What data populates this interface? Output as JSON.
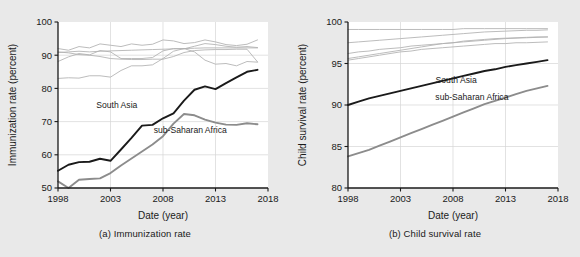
{
  "figure": {
    "background_color": "#e9e9e9",
    "panel_background_color": "#ffffff"
  },
  "colors": {
    "south_asia": "#1a1a1a",
    "sub_saharan_africa": "#8c8c8c",
    "other_regions": "#b0b0b0",
    "grid": "#d6d6d6",
    "axis": "#1a1a1a",
    "text": "#1a1a1a"
  },
  "panels": [
    {
      "id": "a",
      "caption": "(a) Immunization rate",
      "xlabel": "Date (year)",
      "ylabel": "Immunization rate (percent)",
      "xticks": [
        "1998",
        "2003",
        "2008",
        "2013",
        "2018"
      ],
      "yticks": [
        "50",
        "60",
        "70",
        "80",
        "90",
        "100"
      ],
      "annotations": [
        {
          "label": "South Asia",
          "x": 2003.6,
          "y": 74.2
        },
        {
          "label": "sub-Saharan Africa",
          "x": 2010.6,
          "y": 66.6
        }
      ]
    },
    {
      "id": "b",
      "caption": "(b) Child survival rate",
      "xlabel": "Date (year)",
      "ylabel": "Child survival rate (percent)",
      "xticks": [
        "1998",
        "2003",
        "2008",
        "2013",
        "2018"
      ],
      "yticks": [
        "80",
        "85",
        "90",
        "95",
        "100"
      ],
      "annotations": [
        {
          "label": "South Asia",
          "x": 2008.3,
          "y": 92.7
        },
        {
          "label": "sub-Saharan Africa",
          "x": 2009.8,
          "y": 90.6
        }
      ]
    }
  ],
  "chart_data": [
    {
      "type": "line",
      "title": "(a) Immunization rate",
      "xlabel": "Date (year)",
      "ylabel": "Immunization rate (percent)",
      "xlim": [
        1998,
        2018
      ],
      "ylim": [
        50,
        100
      ],
      "xticks": [
        1998,
        2003,
        2008,
        2013,
        2018
      ],
      "yticks": [
        50,
        60,
        70,
        80,
        90,
        100
      ],
      "grid": true,
      "legend": "inline-annotations",
      "x": [
        1998,
        1999,
        2000,
        2001,
        2002,
        2003,
        2004,
        2005,
        2006,
        2007,
        2008,
        2009,
        2010,
        2011,
        2012,
        2013,
        2014,
        2015,
        2016,
        2017
      ],
      "series": [
        {
          "name": "South Asia",
          "color": "#1a1a1a",
          "emphasis": true,
          "values": [
            55.2,
            57.0,
            57.8,
            57.9,
            58.8,
            58.2,
            61.6,
            65.1,
            68.8,
            69.0,
            71.0,
            72.5,
            76.3,
            79.6,
            80.6,
            79.8,
            81.6,
            83.3,
            85.0,
            85.6
          ]
        },
        {
          "name": "sub-Saharan Africa",
          "color": "#8c8c8c",
          "emphasis": true,
          "values": [
            52.0,
            50.0,
            52.5,
            52.7,
            52.9,
            54.5,
            56.8,
            58.9,
            61.0,
            63.1,
            65.6,
            69.4,
            72.3,
            71.9,
            70.6,
            69.7,
            69.1,
            69.0,
            69.5,
            69.2
          ]
        },
        {
          "name": "region-3",
          "color": "#b0b0b0",
          "emphasis": false,
          "values": [
            92.0,
            91.5,
            92.6,
            92.2,
            93.4,
            93.0,
            92.6,
            93.4,
            93.0,
            93.3,
            94.6,
            94.3,
            93.5,
            93.8,
            94.6,
            94.0,
            93.2,
            92.9,
            93.3,
            94.6
          ]
        },
        {
          "name": "region-4",
          "color": "#b0b0b0",
          "emphasis": false,
          "values": [
            90.8,
            91.0,
            91.2,
            91.0,
            91.2,
            91.3,
            91.4,
            91.5,
            91.6,
            91.7,
            91.8,
            91.9,
            92.0,
            92.1,
            92.2,
            92.2,
            92.2,
            92.2,
            92.2,
            92.2
          ]
        },
        {
          "name": "region-5",
          "color": "#b0b0b0",
          "emphasis": false,
          "values": [
            88.1,
            89.5,
            90.5,
            90.1,
            91.4,
            91.0,
            89.0,
            89.0,
            89.0,
            89.3,
            91.3,
            92.0,
            91.9,
            92.7,
            93.5,
            93.2,
            92.7,
            92.4,
            92.6,
            92.3
          ]
        },
        {
          "name": "region-6",
          "color": "#b0b0b0",
          "emphasis": false,
          "values": [
            91.0,
            90.7,
            90.2,
            90.0,
            89.6,
            89.0,
            88.8,
            88.7,
            88.7,
            88.8,
            88.8,
            89.6,
            90.8,
            91.4,
            91.6,
            91.7,
            91.7,
            91.8,
            91.8,
            88.0
          ]
        },
        {
          "name": "region-7",
          "color": "#b0b0b0",
          "emphasis": false,
          "values": [
            83.0,
            83.2,
            83.1,
            83.8,
            83.8,
            83.4,
            85.4,
            86.8,
            86.8,
            87.1,
            89.0,
            91.2,
            92.0,
            91.0,
            88.5,
            87.3,
            87.5,
            86.8,
            88.1,
            87.9
          ]
        }
      ]
    },
    {
      "type": "line",
      "title": "(b) Child survival rate",
      "xlabel": "Date (year)",
      "ylabel": "Child survival rate (percent)",
      "xlim": [
        1998,
        2018
      ],
      "ylim": [
        80,
        100
      ],
      "xticks": [
        1998,
        2003,
        2008,
        2013,
        2018
      ],
      "yticks": [
        80,
        85,
        90,
        95,
        100
      ],
      "grid": true,
      "legend": "inline-annotations",
      "x": [
        1998,
        1999,
        2000,
        2001,
        2002,
        2003,
        2004,
        2005,
        2006,
        2007,
        2008,
        2009,
        2010,
        2011,
        2012,
        2013,
        2014,
        2015,
        2016,
        2017
      ],
      "series": [
        {
          "name": "South Asia",
          "color": "#1a1a1a",
          "emphasis": true,
          "values": [
            90.0,
            90.4,
            90.8,
            91.1,
            91.4,
            91.7,
            92.0,
            92.3,
            92.6,
            92.9,
            93.2,
            93.5,
            93.8,
            94.1,
            94.3,
            94.6,
            94.8,
            95.0,
            95.2,
            95.4
          ]
        },
        {
          "name": "sub-Saharan Africa",
          "color": "#8c8c8c",
          "emphasis": true,
          "values": [
            83.8,
            84.2,
            84.6,
            85.1,
            85.6,
            86.1,
            86.6,
            87.1,
            87.6,
            88.1,
            88.6,
            89.1,
            89.6,
            90.1,
            90.5,
            90.9,
            91.3,
            91.7,
            92.0,
            92.3
          ]
        },
        {
          "name": "region-3",
          "color": "#b0b0b0",
          "emphasis": false,
          "values": [
            99.1,
            99.1,
            99.1,
            99.1,
            99.1,
            99.1,
            99.1,
            99.1,
            99.1,
            99.1,
            99.1,
            99.2,
            99.2,
            99.2,
            99.2,
            99.2,
            99.2,
            99.2,
            99.2,
            99.2
          ]
        },
        {
          "name": "region-4",
          "color": "#b0b0b0",
          "emphasis": false,
          "values": [
            97.5,
            97.6,
            97.7,
            97.8,
            97.9,
            98.0,
            98.1,
            98.2,
            98.3,
            98.4,
            98.5,
            98.6,
            98.7,
            98.8,
            98.85,
            98.9,
            98.95,
            99.0,
            99.0,
            99.05
          ]
        },
        {
          "name": "region-5",
          "color": "#b0b0b0",
          "emphasis": false,
          "values": [
            96.2,
            96.4,
            96.5,
            96.7,
            96.8,
            96.9,
            97.1,
            97.2,
            97.3,
            97.4,
            97.5,
            97.6,
            97.7,
            97.8,
            97.9,
            98.0,
            98.05,
            98.1,
            98.15,
            98.2
          ]
        },
        {
          "name": "region-6",
          "color": "#b0b0b0",
          "emphasis": false,
          "values": [
            95.6,
            95.8,
            96.0,
            96.2,
            96.4,
            96.6,
            96.8,
            97.0,
            97.2,
            97.4,
            97.5,
            97.7,
            97.8,
            97.9,
            98.0,
            98.05,
            98.1,
            98.15,
            98.2,
            98.2
          ]
        },
        {
          "name": "region-7",
          "color": "#b0b0b0",
          "emphasis": false,
          "values": [
            95.4,
            95.6,
            95.8,
            96.0,
            96.2,
            96.4,
            96.5,
            96.7,
            96.8,
            96.9,
            97.0,
            97.1,
            97.2,
            97.3,
            97.4,
            97.4,
            97.5,
            97.5,
            97.55,
            97.6
          ]
        }
      ]
    }
  ]
}
